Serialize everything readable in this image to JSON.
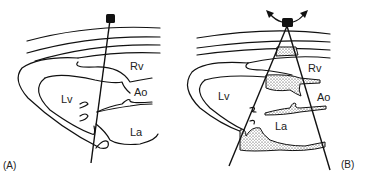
{
  "panels": [
    {
      "id": "A",
      "caption": "(A)",
      "labels": {
        "rv": "Rv",
        "ao": "Ao",
        "lv": "Lv",
        "la": "La"
      }
    },
    {
      "id": "B",
      "caption": "(B)",
      "labels": {
        "rv": "Rv",
        "ao": "Ao",
        "lv": "Lv",
        "la": "La"
      }
    }
  ],
  "colors": {
    "ink": "#111111",
    "background": "#ffffff"
  }
}
